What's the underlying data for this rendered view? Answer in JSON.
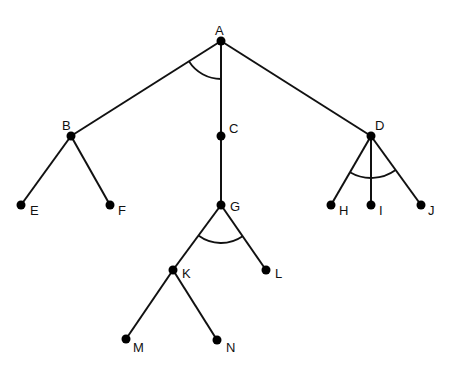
{
  "diagram": {
    "type": "and-or-tree",
    "colors": {
      "line": "#111111",
      "node": "#000000",
      "background": "#ffffff"
    },
    "nodes": [
      {
        "id": "A",
        "label": "A",
        "x": 221,
        "y": 41,
        "lx": 215,
        "ly": 32
      },
      {
        "id": "B",
        "label": "B",
        "x": 71,
        "y": 136,
        "lx": 62,
        "ly": 127
      },
      {
        "id": "C",
        "label": "C",
        "x": 221,
        "y": 136,
        "lx": 229,
        "ly": 130
      },
      {
        "id": "D",
        "label": "D",
        "x": 371,
        "y": 136,
        "lx": 375,
        "ly": 127
      },
      {
        "id": "E",
        "label": "E",
        "x": 21,
        "y": 205,
        "lx": 30,
        "ly": 212
      },
      {
        "id": "F",
        "label": "F",
        "x": 110,
        "y": 205,
        "lx": 118,
        "ly": 212
      },
      {
        "id": "G",
        "label": "G",
        "x": 221,
        "y": 205,
        "lx": 230,
        "ly": 208
      },
      {
        "id": "H",
        "label": "H",
        "x": 331,
        "y": 205,
        "lx": 339,
        "ly": 212
      },
      {
        "id": "I",
        "label": "I",
        "x": 371,
        "y": 205,
        "lx": 379,
        "ly": 212
      },
      {
        "id": "J",
        "label": "J",
        "x": 421,
        "y": 205,
        "lx": 428,
        "ly": 212
      },
      {
        "id": "K",
        "label": "K",
        "x": 173,
        "y": 270,
        "lx": 182,
        "ly": 275
      },
      {
        "id": "L",
        "label": "L",
        "x": 266,
        "y": 270,
        "lx": 275,
        "ly": 275
      },
      {
        "id": "M",
        "label": "M",
        "x": 126,
        "y": 339,
        "lx": 133,
        "ly": 349
      },
      {
        "id": "N",
        "label": "N",
        "x": 217,
        "y": 340,
        "lx": 226,
        "ly": 349
      }
    ],
    "edges": [
      [
        "A",
        "B"
      ],
      [
        "A",
        "C"
      ],
      [
        "A",
        "D"
      ],
      [
        "B",
        "E"
      ],
      [
        "B",
        "F"
      ],
      [
        "C",
        "G"
      ],
      [
        "D",
        "H"
      ],
      [
        "D",
        "I"
      ],
      [
        "D",
        "J"
      ],
      [
        "G",
        "K"
      ],
      [
        "G",
        "L"
      ],
      [
        "K",
        "M"
      ],
      [
        "K",
        "N"
      ]
    ],
    "and_arcs": [
      {
        "node": "A",
        "from": "B",
        "to": "C",
        "radius": 38
      },
      {
        "node": "D",
        "from": "H",
        "to": "J",
        "radius": 42
      },
      {
        "node": "G",
        "from": "K",
        "to": "L",
        "radius": 38
      }
    ]
  }
}
